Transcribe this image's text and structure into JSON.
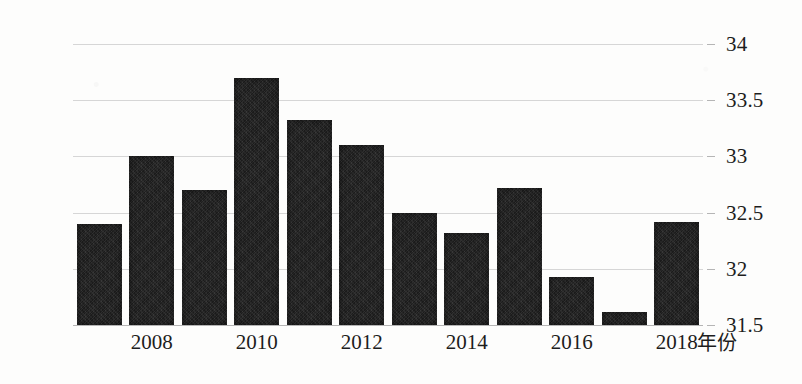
{
  "chart_data": {
    "type": "bar",
    "title": "",
    "subtitle": "",
    "xlabel": "年份",
    "ylabel": "",
    "categories": [
      "2007",
      "2008",
      "2009",
      "2010",
      "2011",
      "2012",
      "2013",
      "2014",
      "2015",
      "2016",
      "2017",
      "2018"
    ],
    "values": [
      32.4,
      33.0,
      32.7,
      33.7,
      33.32,
      33.1,
      32.5,
      32.32,
      32.72,
      31.93,
      31.62,
      32.42
    ],
    "series": [
      {
        "name": "",
        "values": [
          32.4,
          33.0,
          32.7,
          33.7,
          33.32,
          33.1,
          32.5,
          32.32,
          32.72,
          31.93,
          31.62,
          32.42
        ]
      }
    ],
    "ylim": [
      31.5,
      34
    ],
    "y_ticks": [
      31.5,
      32,
      32.5,
      33,
      33.5,
      34
    ],
    "y_tick_labels": [
      "31.5",
      "32",
      "32.5",
      "33",
      "33.5",
      "34"
    ],
    "x_tick_labels": [
      "2008",
      "2010",
      "2012",
      "2014",
      "2016",
      "2018"
    ],
    "grid": true,
    "legend": false,
    "legend_position": "none",
    "y_axis_side": "right",
    "bar_color": "#262626",
    "grid_color": "#cfcfcf",
    "background_color": "#fdfdfc",
    "text_color": "#1d1d1d"
  },
  "axis": {
    "x_title": "年份",
    "y_labels": [
      "34",
      "33.5",
      "33",
      "32.5",
      "32",
      "31.5"
    ],
    "x_labels": [
      "2008",
      "2010",
      "2012",
      "2014",
      "2016",
      "2018"
    ]
  }
}
